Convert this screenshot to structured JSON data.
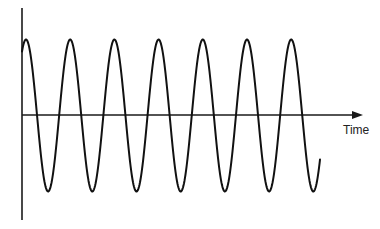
{
  "diagram": {
    "type": "sine-wave",
    "x_axis_label": "Time",
    "y_axis_label": "",
    "colors": {
      "background": "#ffffff",
      "axis": "#1a1a1a",
      "wave": "#111111",
      "label": "#222222"
    },
    "wave": {
      "cycles_visible": 7,
      "peaks": 7,
      "troughs": 7
    }
  }
}
